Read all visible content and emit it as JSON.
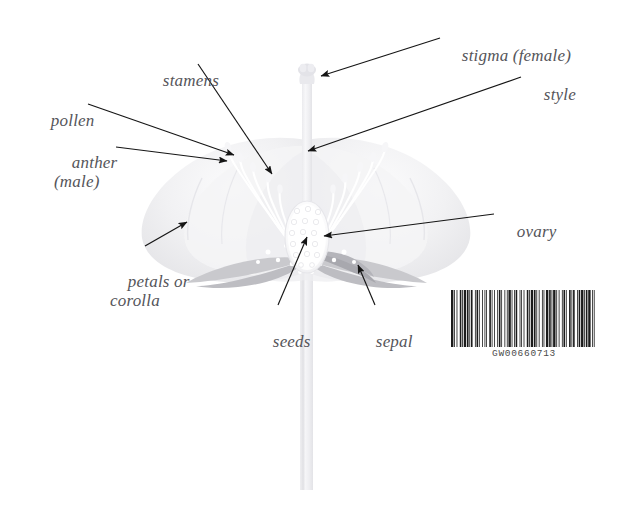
{
  "figure": {
    "kind": "botanical-diagram",
    "background_color": "#ffffff",
    "label_color": "#55555a",
    "arrow_color": "#151515"
  },
  "labels": [
    {
      "id": "stigma",
      "text": "stigma (female)",
      "x": 444,
      "y": 27,
      "lines": 1
    },
    {
      "id": "style",
      "text": "style",
      "x": 526,
      "y": 66,
      "lines": 1
    },
    {
      "id": "stamens",
      "text": "stamens",
      "x": 145,
      "y": 52,
      "lines": 1
    },
    {
      "id": "pollen",
      "text": "pollen",
      "x": 33,
      "y": 92,
      "lines": 1
    },
    {
      "id": "anther",
      "text": "anther\n(male)",
      "x": 54,
      "y": 133,
      "lines": 2
    },
    {
      "id": "petals",
      "text": "petals or\ncorolla",
      "x": 110,
      "y": 252,
      "lines": 2
    },
    {
      "id": "seeds",
      "text": "seeds",
      "x": 255,
      "y": 313,
      "lines": 1
    },
    {
      "id": "sepal",
      "text": "sepal",
      "x": 358,
      "y": 313,
      "lines": 1
    },
    {
      "id": "ovary",
      "text": "ovary",
      "x": 499,
      "y": 203,
      "lines": 1
    }
  ],
  "leaders": [
    {
      "id": "stigma-leader",
      "from_x": 440,
      "from_y": 38,
      "to_x": 321,
      "to_y": 76
    },
    {
      "id": "style-leader",
      "from_x": 521,
      "from_y": 77,
      "to_x": 308,
      "to_y": 151
    },
    {
      "id": "stamens-leader",
      "from_x": 198,
      "from_y": 64,
      "to_x": 272,
      "to_y": 174
    },
    {
      "id": "pollen-leader",
      "from_x": 88,
      "from_y": 104,
      "to_x": 234,
      "to_y": 155
    },
    {
      "id": "anther-leader",
      "from_x": 116,
      "from_y": 147,
      "to_x": 227,
      "to_y": 161
    },
    {
      "id": "petals-leader",
      "from_x": 145,
      "from_y": 246,
      "to_x": 187,
      "to_y": 222
    },
    {
      "id": "seeds-leader",
      "from_x": 278,
      "from_y": 305,
      "to_x": 307,
      "to_y": 237
    },
    {
      "id": "sepal-leader",
      "from_x": 375,
      "from_y": 305,
      "to_x": 358,
      "to_y": 265
    },
    {
      "id": "ovary-leader",
      "from_x": 494,
      "from_y": 214,
      "to_x": 324,
      "to_y": 236
    }
  ],
  "barcode": {
    "code_text": "GW00660713",
    "bar_color": "#1b1b1b",
    "widths": [
      3,
      1,
      1,
      2,
      1,
      3,
      2,
      1,
      1,
      1,
      3,
      1,
      2,
      1,
      1,
      1,
      2,
      3,
      1,
      1,
      2,
      1,
      1,
      3,
      1,
      2,
      1,
      1,
      1,
      3,
      2,
      1,
      1,
      2,
      1,
      3,
      1,
      1,
      2,
      1,
      1,
      3,
      1,
      2,
      1,
      1,
      3,
      1,
      1,
      2,
      1,
      1,
      2,
      3,
      1,
      1,
      1,
      2,
      1,
      3,
      2,
      1,
      1,
      1,
      3,
      1,
      2,
      1,
      1,
      2,
      1,
      3,
      1,
      1,
      1,
      2,
      3,
      1,
      2,
      1,
      1,
      1,
      3,
      1,
      1,
      2,
      1,
      3,
      1,
      1,
      2,
      1,
      1,
      3,
      2,
      1,
      1,
      1,
      2,
      3,
      1,
      1,
      2,
      1,
      3,
      1,
      1,
      1,
      2,
      1,
      3,
      2,
      1,
      1,
      1,
      3
    ]
  }
}
